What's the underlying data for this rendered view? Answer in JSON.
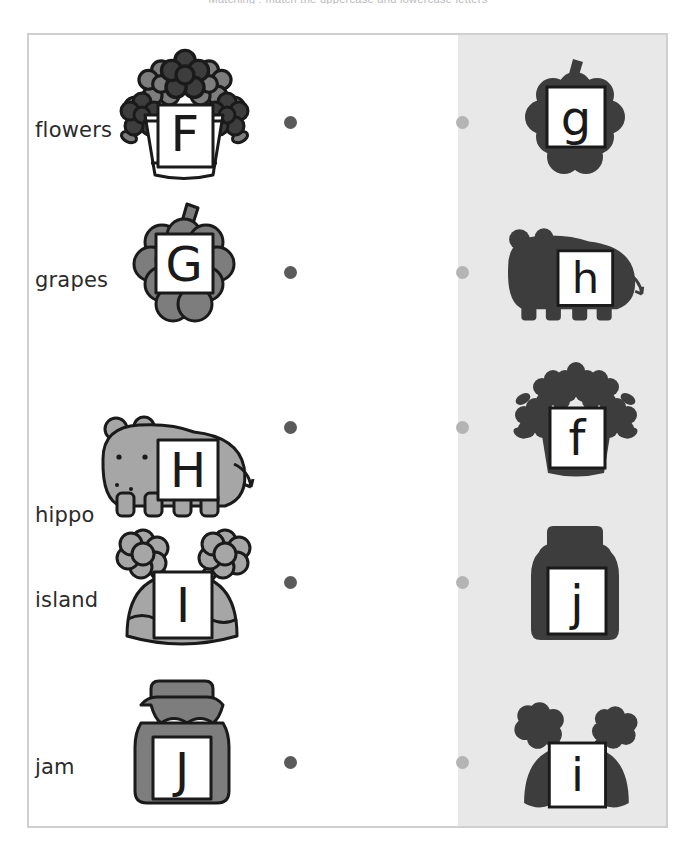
{
  "worksheet": {
    "top_instruction": "Matching : match the uppercase and lowercase letters",
    "colors": {
      "frame_border": "#cfcfd2",
      "shaded_panel": "#e8e8e8",
      "dot_left": "#5a5a5a",
      "dot_right": "#b4b4b4",
      "silhouette": "#3d3d3d",
      "mid_gray": "#7d7d7d",
      "light_gray": "#a6a6a6",
      "outline": "#1a1a1a",
      "label_text": "#2b2b2b"
    },
    "left_column": [
      {
        "word": "flowers",
        "letter": "F",
        "icon": "flower-pot-icon"
      },
      {
        "word": "grapes",
        "letter": "G",
        "icon": "grapes-icon"
      },
      {
        "word": "hippo",
        "letter": "H",
        "icon": "hippo-icon"
      },
      {
        "word": "island",
        "letter": "I",
        "icon": "island-icon"
      },
      {
        "word": "jam",
        "letter": "J",
        "icon": "jam-jar-icon"
      }
    ],
    "right_column": [
      {
        "letter": "g",
        "icon": "grapes-silhouette-icon"
      },
      {
        "letter": "h",
        "icon": "hippo-silhouette-icon"
      },
      {
        "letter": "f",
        "icon": "flower-pot-silhouette-icon"
      },
      {
        "letter": "j",
        "icon": "jam-jar-silhouette-icon"
      },
      {
        "letter": "i",
        "icon": "island-silhouette-icon"
      }
    ]
  }
}
